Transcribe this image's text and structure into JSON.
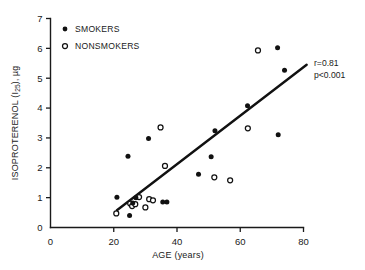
{
  "chart_data": {
    "type": "scatter",
    "title": "",
    "xlabel": "AGE (years)",
    "ylabel": "ISOPROTERENOL (I25), µg",
    "ylabel_parts": {
      "main": "ISOPROTERENOL (I",
      "subscript": "25",
      "tail": "), µg"
    },
    "xlim": [
      0,
      80
    ],
    "ylim": [
      0,
      7
    ],
    "xticks": [
      0,
      20,
      40,
      60,
      80
    ],
    "yticks": [
      0,
      1,
      2,
      3,
      4,
      5,
      6,
      7
    ],
    "xtick_labels": [
      "0",
      "20",
      "40",
      "60",
      "80"
    ],
    "ytick_labels": [
      "0",
      "1",
      "2",
      "3",
      "4",
      "5",
      "6",
      "7"
    ],
    "grid": false,
    "legend_position": "top-left",
    "series": [
      {
        "name": "SMOKERS",
        "marker": "filled-circle",
        "color": "#111111",
        "points": [
          [
            21.0,
            1.01
          ],
          [
            24.5,
            2.39
          ],
          [
            25.0,
            0.4
          ],
          [
            26.0,
            0.82
          ],
          [
            27.0,
            1.0
          ],
          [
            31.0,
            2.98
          ],
          [
            35.5,
            0.85
          ],
          [
            36.8,
            0.85
          ],
          [
            46.8,
            1.78
          ],
          [
            50.8,
            2.37
          ],
          [
            52.0,
            3.24
          ],
          [
            62.3,
            4.08
          ],
          [
            71.8,
            6.02
          ],
          [
            72.0,
            3.11
          ],
          [
            74.0,
            5.27
          ]
        ]
      },
      {
        "name": "NONSMOKERS",
        "marker": "open-circle",
        "color": "#111111",
        "points": [
          [
            20.8,
            0.47
          ],
          [
            25.2,
            0.8
          ],
          [
            25.8,
            0.72
          ],
          [
            26.8,
            0.78
          ],
          [
            28.0,
            1.02
          ],
          [
            30.0,
            0.67
          ],
          [
            31.2,
            0.95
          ],
          [
            32.4,
            0.91
          ],
          [
            34.8,
            3.35
          ],
          [
            36.2,
            2.06
          ],
          [
            51.8,
            1.68
          ],
          [
            56.8,
            1.58
          ],
          [
            62.4,
            3.32
          ],
          [
            65.6,
            5.93
          ]
        ]
      }
    ],
    "fit_line": {
      "x_start": 21.0,
      "y_start": 0.58,
      "x_end": 81.0,
      "y_end": 5.45
    },
    "annotations": [
      {
        "text": "r=0.81",
        "x": 84,
        "y": 5.95
      },
      {
        "text": "p<0.001",
        "x": 84,
        "y": 5.35
      }
    ]
  },
  "legend": {
    "items": [
      {
        "label": "SMOKERS",
        "marker": "filled-circle"
      },
      {
        "label": "NONSMOKERS",
        "marker": "open-circle"
      }
    ]
  },
  "annotation": {
    "r_value": "r=0.81",
    "p_value": "p<0.001"
  },
  "colors": {
    "ink": "#111111",
    "background": "#ffffff"
  }
}
